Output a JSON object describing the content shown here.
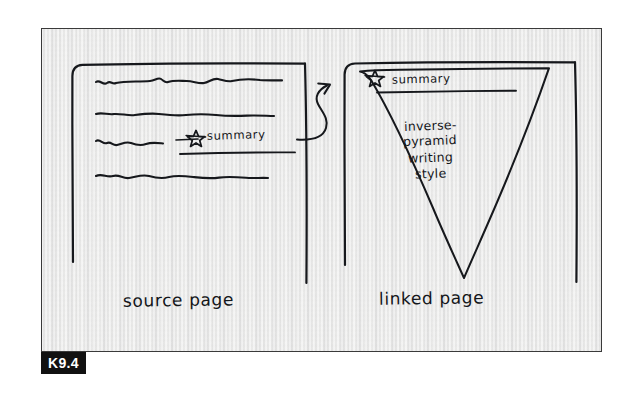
{
  "figure": {
    "tag": "K9.4",
    "background_color": "#f1f1f0",
    "ink_color": "#14161a",
    "frame_color": "#3a3a3a",
    "tag_background": "#111111",
    "tag_text_color": "#ffffff"
  },
  "source_page": {
    "caption": "source page",
    "text_lines": 4,
    "annotation": {
      "icon": "star-icon",
      "label": "summary",
      "underline": true
    }
  },
  "connector": {
    "icon": "curved-arrow-icon",
    "from": "source-page-summary-line",
    "to": "linked-page-summary"
  },
  "linked_page": {
    "caption": "linked page",
    "shape": "inverted-triangle",
    "header": {
      "icon": "star-icon",
      "label": "summary",
      "divider": true
    },
    "body_lines": [
      "inverse-",
      "pyramid",
      "writing",
      "style"
    ]
  }
}
